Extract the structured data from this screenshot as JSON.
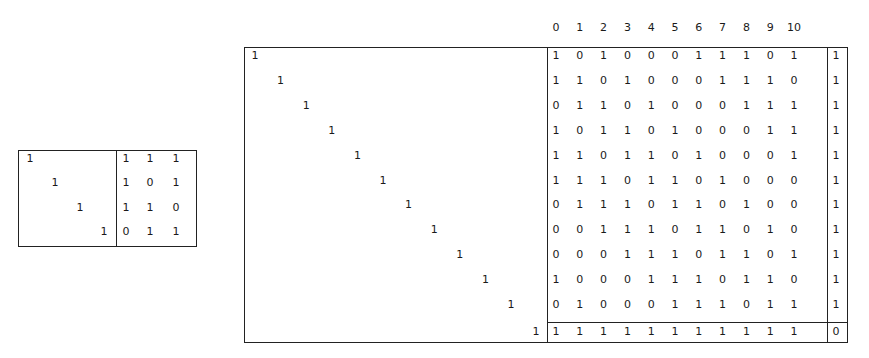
{
  "small_matrix": {
    "identity_size": 3,
    "identity_rows": [
      [
        1,
        0,
        0,
        0
      ],
      [
        0,
        1,
        0,
        0
      ],
      [
        0,
        0,
        1,
        0
      ],
      [
        0,
        0,
        0,
        1
      ]
    ],
    "identity_value": "1",
    "parity_rows": [
      [
        "1",
        "1",
        "1"
      ],
      [
        "1",
        "0",
        "1"
      ],
      [
        "1",
        "1",
        "0"
      ],
      [
        "0",
        "1",
        "1"
      ]
    ]
  },
  "large_matrix": {
    "column_headers": [
      "0",
      "1",
      "2",
      "3",
      "4",
      "5",
      "6",
      "7",
      "8",
      "9",
      "10"
    ],
    "identity_value": "1",
    "identity_count": 12,
    "body_rows": [
      [
        "1",
        "0",
        "1",
        "0",
        "0",
        "0",
        "1",
        "1",
        "1",
        "0",
        "1"
      ],
      [
        "1",
        "1",
        "0",
        "1",
        "0",
        "0",
        "0",
        "1",
        "1",
        "1",
        "0"
      ],
      [
        "0",
        "1",
        "1",
        "0",
        "1",
        "0",
        "0",
        "0",
        "1",
        "1",
        "1"
      ],
      [
        "1",
        "0",
        "1",
        "1",
        "0",
        "1",
        "0",
        "0",
        "0",
        "1",
        "1"
      ],
      [
        "1",
        "1",
        "0",
        "1",
        "1",
        "0",
        "1",
        "0",
        "0",
        "0",
        "1"
      ],
      [
        "1",
        "1",
        "1",
        "0",
        "1",
        "1",
        "0",
        "1",
        "0",
        "0",
        "0"
      ],
      [
        "0",
        "1",
        "1",
        "1",
        "0",
        "1",
        "1",
        "0",
        "1",
        "0",
        "0"
      ],
      [
        "0",
        "0",
        "1",
        "1",
        "1",
        "0",
        "1",
        "1",
        "0",
        "1",
        "0"
      ],
      [
        "0",
        "0",
        "0",
        "1",
        "1",
        "1",
        "0",
        "1",
        "1",
        "0",
        "1"
      ],
      [
        "1",
        "0",
        "0",
        "0",
        "1",
        "1",
        "1",
        "0",
        "1",
        "1",
        "0"
      ],
      [
        "0",
        "1",
        "0",
        "0",
        "0",
        "1",
        "1",
        "1",
        "0",
        "1",
        "1"
      ]
    ],
    "parity_column": [
      "1",
      "1",
      "1",
      "1",
      "1",
      "1",
      "1",
      "1",
      "1",
      "1",
      "1"
    ],
    "bottom_row": [
      "1",
      "1",
      "1",
      "1",
      "1",
      "1",
      "1",
      "1",
      "1",
      "1",
      "1"
    ],
    "corner_value": "0"
  }
}
